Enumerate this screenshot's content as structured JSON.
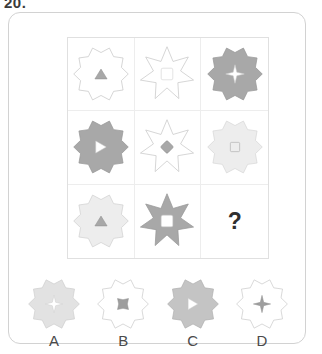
{
  "question_number": "20.",
  "question_mark": "?",
  "palette": {
    "outline": "#c9c9c9",
    "white_fill": "#ffffff",
    "pale_fill": "#ededed",
    "light_fill": "#e2e2e2",
    "gray_fill": "#a8a8a8",
    "mid_gray_fill": "#9e9e9e",
    "card_border": "#d2d2d2",
    "grid_border": "#e0e0e0",
    "text": "#333333"
  },
  "matrix": {
    "rows": 3,
    "cols": 3,
    "cells": [
      {
        "id": "cell-1-1",
        "star_points": 10,
        "star_fill": "#ffffff",
        "star_stroke": "#c9c9c9",
        "inner_shape": "triangle-up",
        "inner_fill": "#a8a8a8",
        "inner_stroke": "#8f8f8f"
      },
      {
        "id": "cell-1-2",
        "star_points": 7,
        "star_fill": "#ffffff",
        "star_stroke": "#c9c9c9",
        "inner_shape": "square",
        "inner_fill": "#ffffff",
        "inner_stroke": "#c9c9c9"
      },
      {
        "id": "cell-1-3",
        "star_points": 10,
        "star_fill": "#a8a8a8",
        "star_stroke": "#999999",
        "inner_shape": "four-point-star",
        "inner_fill": "#ffffff",
        "inner_stroke": "#cccccc"
      },
      {
        "id": "cell-2-1",
        "star_points": 10,
        "star_fill": "#a8a8a8",
        "star_stroke": "#999999",
        "inner_shape": "triangle-right",
        "inner_fill": "#ffffff",
        "inner_stroke": "#cccccc"
      },
      {
        "id": "cell-2-2",
        "star_points": 7,
        "star_fill": "#ffffff",
        "star_stroke": "#c9c9c9",
        "inner_shape": "diamond",
        "inner_fill": "#a8a8a8",
        "inner_stroke": "#8f8f8f"
      },
      {
        "id": "cell-2-3",
        "star_points": 10,
        "star_fill": "#ededed",
        "star_stroke": "#d8d8d8",
        "inner_shape": "square-small",
        "inner_fill": "#ededed",
        "inner_stroke": "#9e9e9e"
      },
      {
        "id": "cell-3-1",
        "star_points": 10,
        "star_fill": "#ededed",
        "star_stroke": "#d2d2d2",
        "inner_shape": "triangle-up",
        "inner_fill": "#a8a8a8",
        "inner_stroke": "#8f8f8f"
      },
      {
        "id": "cell-3-2",
        "star_points": 7,
        "star_fill": "#a8a8a8",
        "star_stroke": "#999999",
        "inner_shape": "square",
        "inner_fill": "#ffffff",
        "inner_stroke": "#cccccc"
      },
      {
        "id": "cell-3-3",
        "star_points": 0,
        "is_question": true
      }
    ]
  },
  "options": [
    {
      "id": "option-a",
      "label": "A",
      "star_points": 10,
      "star_fill": "#e2e2e2",
      "star_stroke": "#cfcfcf",
      "inner_shape": "four-point-star",
      "inner_fill": "#ffffff",
      "inner_stroke": "#cccccc"
    },
    {
      "id": "option-b",
      "label": "B",
      "star_points": 10,
      "star_fill": "#ffffff",
      "star_stroke": "#c9c9c9",
      "inner_shape": "concave-four-point",
      "inner_fill": "#9e9e9e",
      "inner_stroke": "#8f8f8f"
    },
    {
      "id": "option-c",
      "label": "C",
      "star_points": 10,
      "star_fill": "#c4c4c4",
      "star_stroke": "#b0b0b0",
      "inner_shape": "triangle-right",
      "inner_fill": "#ffffff",
      "inner_stroke": "#cccccc"
    },
    {
      "id": "option-d",
      "label": "D",
      "star_points": 10,
      "star_fill": "#ffffff",
      "star_stroke": "#c9c9c9",
      "inner_shape": "four-point-star",
      "inner_fill": "#9e9e9e",
      "inner_stroke": "#8f8f8f"
    }
  ]
}
